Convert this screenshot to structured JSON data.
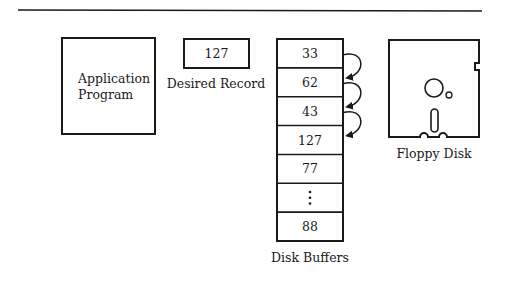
{
  "diagram": {
    "application": {
      "label_line1": "Application",
      "label_line2": "Program"
    },
    "desired_record": {
      "value": "127",
      "label": "Desired Record"
    },
    "disk_buffers": {
      "label": "Disk Buffers",
      "cells": [
        "33",
        "62",
        "43",
        "127",
        "77",
        "⋮",
        "88"
      ],
      "arrows_between": [
        [
          0,
          1
        ],
        [
          1,
          2
        ],
        [
          2,
          3
        ]
      ]
    },
    "floppy_disk": {
      "label": "Floppy Disk"
    },
    "colors": {
      "ink": "#1a1a1a",
      "background": "#ffffff"
    }
  }
}
